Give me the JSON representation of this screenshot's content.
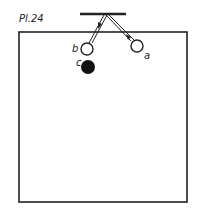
{
  "plate": {
    "label": "Pl.24"
  },
  "labels": {
    "a": "a",
    "b": "b",
    "c": "c"
  },
  "colors": {
    "ink": "#222222",
    "paper": "#ffffff"
  }
}
